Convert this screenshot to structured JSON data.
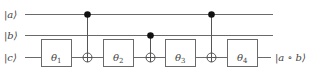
{
  "diagram": {
    "type": "quantum-circuit",
    "qubits": [
      {
        "id": "a",
        "label": "|a⟩",
        "y": 14
      },
      {
        "id": "b",
        "label": "|b⟩",
        "y": 35
      },
      {
        "id": "c",
        "label": "|c⟩",
        "y": 57
      }
    ],
    "gates": [
      {
        "type": "box",
        "target": "c",
        "label": "θ",
        "sub": "1",
        "x1": 41,
        "x2": 71
      },
      {
        "type": "cnot",
        "control": "a",
        "target": "c",
        "x": 87
      },
      {
        "type": "box",
        "target": "c",
        "label": "θ",
        "sub": "2",
        "x1": 103,
        "x2": 133
      },
      {
        "type": "cnot",
        "control": "b",
        "target": "c",
        "x": 150
      },
      {
        "type": "box",
        "target": "c",
        "label": "θ",
        "sub": "3",
        "x1": 165,
        "x2": 195
      },
      {
        "type": "cnot",
        "control": "a",
        "target": "c",
        "x": 211
      },
      {
        "type": "box",
        "target": "c",
        "label": "θ",
        "sub": "4",
        "x1": 227,
        "x2": 257
      }
    ],
    "output_label": "|a ∘ b⟩"
  },
  "labels": {
    "a": "|a⟩",
    "b": "|b⟩",
    "c": "|c⟩",
    "theta": "θ",
    "s1": "1",
    "s2": "2",
    "s3": "3",
    "s4": "4",
    "out": "|a ∘ b⟩"
  }
}
